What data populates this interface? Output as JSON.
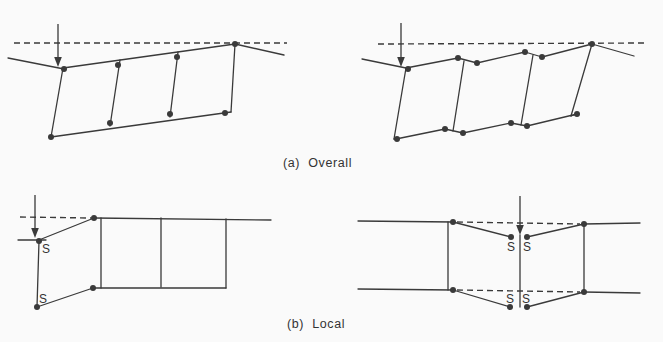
{
  "page": {
    "background": "#fafafa",
    "ink": "#3a3a3a"
  },
  "captions": {
    "a": "(a)  Overall",
    "b": "(b)  Local"
  },
  "diagrams": [
    {
      "name": "overall-left-diagram",
      "dashed": [
        [
          [
            14,
            43
          ],
          [
            287,
            43
          ]
        ]
      ],
      "arrows": [
        {
          "x": 58,
          "y1": 24,
          "y2": 67
        }
      ],
      "solid": [
        [
          [
            8,
            58
          ],
          [
            64,
            69
          ]
        ],
        [
          [
            63,
            68
          ],
          [
            235,
            44
          ]
        ],
        [
          [
            235,
            44
          ],
          [
            284,
            55
          ]
        ],
        [
          [
            63,
            68
          ],
          [
            51,
            137
          ]
        ],
        [
          [
            51,
            137
          ],
          [
            231,
            112
          ]
        ],
        [
          [
            235,
            44
          ],
          [
            231,
            112
          ]
        ],
        [
          [
            120,
            60
          ],
          [
            110,
            126
          ]
        ],
        [
          [
            178,
            52
          ],
          [
            170,
            117
          ]
        ]
      ],
      "dots": [
        [
          64,
          69
        ],
        [
          235,
          44
        ],
        [
          51,
          137
        ],
        [
          225,
          113
        ],
        [
          118,
          65
        ],
        [
          110,
          123
        ],
        [
          177,
          57
        ],
        [
          170,
          114
        ]
      ],
      "labels": []
    },
    {
      "name": "overall-right-diagram",
      "dashed": [
        [
          [
            378,
            44
          ],
          [
            648,
            43
          ]
        ]
      ],
      "arrows": [
        {
          "x": 401,
          "y1": 23,
          "y2": 67
        }
      ],
      "solid": [
        [
          [
            362,
            59
          ],
          [
            406,
            68
          ]
        ],
        [
          [
            406,
            68
          ],
          [
            458,
            58
          ]
        ],
        [
          [
            458,
            58
          ],
          [
            477,
            63
          ]
        ],
        [
          [
            477,
            63
          ],
          [
            525,
            52
          ]
        ],
        [
          [
            525,
            52
          ],
          [
            542,
            57
          ]
        ],
        [
          [
            542,
            57
          ],
          [
            592,
            44
          ]
        ],
        [
          [
            592,
            44
          ],
          [
            634,
            56
          ]
        ],
        [
          [
            406,
            68
          ],
          [
            394,
            139
          ]
        ],
        [
          [
            394,
            139
          ],
          [
            397,
            139
          ]
        ],
        [
          [
            396,
            139
          ],
          [
            445,
            129
          ]
        ],
        [
          [
            445,
            129
          ],
          [
            463,
            133
          ]
        ],
        [
          [
            463,
            133
          ],
          [
            511,
            123
          ]
        ],
        [
          [
            511,
            123
          ],
          [
            527,
            126
          ]
        ],
        [
          [
            527,
            126
          ],
          [
            577,
            114
          ]
        ],
        [
          [
            592,
            44
          ],
          [
            571,
            116
          ]
        ],
        [
          [
            577,
            114
          ],
          [
            571,
            116
          ]
        ],
        [
          [
            464,
            61
          ],
          [
            453,
            131
          ]
        ],
        [
          [
            533,
            55
          ],
          [
            521,
            125
          ]
        ]
      ],
      "dots": [
        [
          408,
          69
        ],
        [
          458,
          58
        ],
        [
          477,
          63
        ],
        [
          525,
          52
        ],
        [
          542,
          57
        ],
        [
          592,
          44
        ],
        [
          397,
          139
        ],
        [
          445,
          129
        ],
        [
          463,
          133
        ],
        [
          511,
          123
        ],
        [
          527,
          126
        ],
        [
          577,
          114
        ]
      ],
      "labels": []
    },
    {
      "name": "local-left-diagram",
      "dashed": [
        [
          [
            20,
            217
          ],
          [
            91,
            218
          ]
        ]
      ],
      "arrows": [
        {
          "x": 35,
          "y1": 195,
          "y2": 238
        }
      ],
      "solid": [
        [
          [
            18,
            240
          ],
          [
            46,
            240
          ]
        ],
        [
          [
            39,
            240
          ],
          [
            94,
            218
          ]
        ],
        [
          [
            39,
            241
          ],
          [
            37,
            307
          ]
        ],
        [
          [
            37,
            307
          ],
          [
            93,
            288
          ]
        ],
        [
          [
            94,
            218
          ],
          [
            271,
            220
          ]
        ],
        [
          [
            93,
            288
          ],
          [
            226,
            288
          ]
        ],
        [
          [
            101,
            218
          ],
          [
            101,
            288
          ]
        ],
        [
          [
            161,
            218
          ],
          [
            161,
            287
          ]
        ],
        [
          [
            226,
            219
          ],
          [
            226,
            288
          ]
        ]
      ],
      "dots": [
        [
          94,
          218
        ],
        [
          39,
          241
        ],
        [
          37,
          307
        ],
        [
          93,
          288
        ]
      ],
      "labels": [
        {
          "text": "S",
          "x": 42,
          "y": 253
        },
        {
          "text": "S",
          "x": 39,
          "y": 303
        }
      ]
    },
    {
      "name": "local-right-diagram",
      "dashed": [
        [
          [
            457,
            222
          ],
          [
            580,
            224
          ]
        ],
        [
          [
            457,
            290
          ],
          [
            580,
            292
          ]
        ]
      ],
      "arrows": [
        {
          "x": 520,
          "y1": 196,
          "y2": 235
        }
      ],
      "solid": [
        [
          [
            358,
            221
          ],
          [
            453,
            222
          ]
        ],
        [
          [
            453,
            222
          ],
          [
            511,
            237
          ]
        ],
        [
          [
            527,
            237
          ],
          [
            584,
            224
          ]
        ],
        [
          [
            584,
            224
          ],
          [
            640,
            223
          ]
        ],
        [
          [
            358,
            289
          ],
          [
            453,
            290
          ]
        ],
        [
          [
            453,
            290
          ],
          [
            510,
            307
          ]
        ],
        [
          [
            527,
            307
          ],
          [
            584,
            292
          ]
        ],
        [
          [
            584,
            292
          ],
          [
            640,
            293
          ]
        ],
        [
          [
            448,
            222
          ],
          [
            448,
            290
          ]
        ],
        [
          [
            584,
            224
          ],
          [
            584,
            292
          ]
        ],
        [
          [
            520,
            235
          ],
          [
            520,
            307
          ]
        ]
      ],
      "dots": [
        [
          453,
          222
        ],
        [
          584,
          224
        ],
        [
          511,
          237
        ],
        [
          527,
          237
        ],
        [
          453,
          290
        ],
        [
          584,
          292
        ],
        [
          510,
          307
        ],
        [
          527,
          307
        ]
      ],
      "labels": [
        {
          "text": "S",
          "x": 507,
          "y": 251
        },
        {
          "text": "S",
          "x": 523,
          "y": 251
        },
        {
          "text": "S",
          "x": 506,
          "y": 303
        },
        {
          "text": "S",
          "x": 522,
          "y": 303
        }
      ]
    }
  ]
}
